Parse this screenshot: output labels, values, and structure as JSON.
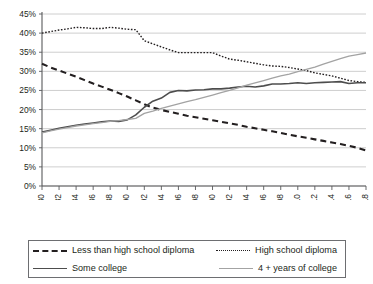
{
  "chart_data": {
    "type": "line",
    "title": "",
    "subtitle": "",
    "xlabel": "",
    "ylabel": "",
    "xlim": [
      1980,
      2018
    ],
    "ylim": [
      0,
      45
    ],
    "grid": true,
    "legend_position": "bottom",
    "ytick_labels": [
      "45%",
      "40%",
      "35%",
      "30%",
      "25%",
      "20%",
      "15%",
      "10%",
      "5%",
      "0%"
    ],
    "ytick_values": [
      45,
      40,
      35,
      30,
      25,
      20,
      15,
      10,
      5,
      0
    ],
    "xtick_labels": [
      "1980",
      "1982",
      "1984",
      "1986",
      "1988",
      "1990",
      "1992",
      "1994",
      "1996",
      "1998",
      "2000",
      "2002",
      "2004",
      "2006",
      "2008",
      "2010",
      "2012",
      "2014",
      "2016",
      "2018"
    ],
    "x": [
      1980,
      1981,
      1982,
      1983,
      1984,
      1985,
      1986,
      1987,
      1988,
      1989,
      1990,
      1991,
      1992,
      1993,
      1994,
      1995,
      1996,
      1997,
      1998,
      1999,
      2000,
      2001,
      2002,
      2003,
      2004,
      2005,
      2006,
      2007,
      2008,
      2009,
      2010,
      2011,
      2012,
      2013,
      2014,
      2015,
      2016,
      2017,
      2018
    ],
    "series": [
      {
        "name": "Less than high school diploma",
        "style": "dashed",
        "color": "#231f20",
        "values": [
          32.0,
          31.0,
          30.2,
          29.4,
          28.6,
          27.7,
          26.8,
          26.0,
          25.2,
          24.3,
          23.4,
          22.4,
          21.4,
          20.5,
          19.9,
          19.4,
          18.9,
          18.4,
          18.0,
          17.6,
          17.2,
          16.8,
          16.4,
          16.0,
          15.5,
          15.1,
          14.7,
          14.3,
          13.9,
          13.4,
          13.0,
          12.6,
          12.2,
          11.8,
          11.4,
          11.0,
          10.5,
          10.0,
          9.3
        ]
      },
      {
        "name": "High school diploma",
        "style": "dotted",
        "color": "#231f20",
        "values": [
          40.0,
          40.4,
          40.8,
          41.1,
          41.5,
          41.4,
          41.2,
          41.2,
          41.5,
          41.3,
          41.0,
          40.9,
          38.0,
          37.2,
          36.4,
          35.6,
          34.9,
          34.9,
          34.9,
          34.9,
          34.9,
          34.0,
          33.2,
          32.9,
          32.5,
          32.1,
          31.7,
          31.4,
          31.3,
          31.0,
          30.6,
          30.2,
          29.6,
          29.2,
          28.8,
          28.2,
          27.6,
          27.3,
          27.1
        ]
      },
      {
        "name": "Some college",
        "style": "solid",
        "color": "#4d4d4d",
        "values": [
          14.1,
          14.6,
          15.1,
          15.5,
          15.9,
          16.2,
          16.5,
          16.8,
          17.0,
          16.9,
          17.3,
          18.6,
          20.6,
          22.2,
          23.0,
          24.5,
          25.0,
          24.9,
          25.1,
          25.2,
          25.4,
          25.4,
          25.6,
          25.9,
          26.1,
          25.9,
          26.2,
          26.7,
          26.7,
          26.8,
          27.0,
          26.8,
          27.0,
          27.1,
          27.2,
          27.3,
          26.8,
          27.0,
          27.0
        ]
      },
      {
        "name": "4 + years of college",
        "style": "solid-light",
        "color": "#a3a3a3",
        "values": [
          13.9,
          14.4,
          14.9,
          15.3,
          15.7,
          16.0,
          16.3,
          16.6,
          16.9,
          17.1,
          17.4,
          17.7,
          19.0,
          19.6,
          20.3,
          20.9,
          21.5,
          22.1,
          22.6,
          23.2,
          23.8,
          24.4,
          25.0,
          25.7,
          26.4,
          27.0,
          27.6,
          28.2,
          28.8,
          29.3,
          29.9,
          30.5,
          31.1,
          31.9,
          32.6,
          33.3,
          34.0,
          34.4,
          34.8
        ]
      }
    ]
  },
  "legend": {
    "items": [
      {
        "label": "Less than high school diploma",
        "swatch": "dashed-line-swatch"
      },
      {
        "label": "High school diploma",
        "swatch": "dotted-line-swatch"
      },
      {
        "label": "Some college",
        "swatch": "solid-line-swatch"
      },
      {
        "label": "4 + years of college",
        "swatch": "light-line-swatch"
      }
    ]
  }
}
